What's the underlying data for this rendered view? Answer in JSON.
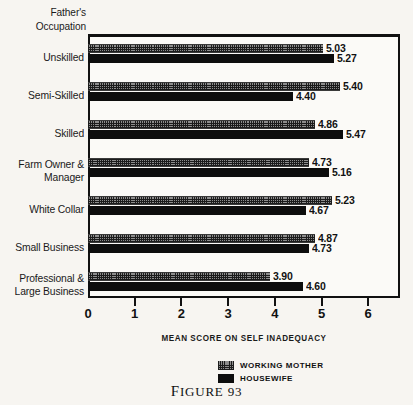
{
  "axis_title": "Father's\nOccupation",
  "caption": "FIGURE 93",
  "legend": {
    "items": [
      {
        "label": "WORKING MOTHER",
        "key": "working_mother",
        "pattern": "cross-hatch",
        "color": "#8d8d8d"
      },
      {
        "label": "HOUSEWIFE",
        "key": "housewife",
        "pattern": "solid",
        "color": "#0d0d0d"
      }
    ]
  },
  "chart_data": {
    "type": "bar",
    "orientation": "horizontal",
    "title": "",
    "subtitle": "",
    "xlabel": "MEAN SCORE ON SELF INADEQUACY",
    "ylabel": "Father's Occupation",
    "xlim": [
      0,
      6.7
    ],
    "xticks": [
      0,
      1,
      2,
      3,
      4,
      5,
      6
    ],
    "xtick_labels": [
      "0",
      "1",
      "2",
      "3",
      "4",
      "5",
      "6"
    ],
    "grid": false,
    "legend_position": "bottom-center",
    "categories": [
      "Unskilled",
      "Semi-Skilled",
      "Skilled",
      "Farm Owner &\nManager",
      "White Collar",
      "Small Business",
      "Professional &\nLarge Business"
    ],
    "series": [
      {
        "name": "WORKING MOTHER",
        "values": [
          5.03,
          5.4,
          4.86,
          4.73,
          5.23,
          4.87,
          3.9
        ],
        "value_labels": [
          "5.03",
          "5.40",
          "4.86",
          "4.73",
          "5.23",
          "4.87",
          "3.90"
        ]
      },
      {
        "name": "HOUSEWIFE",
        "values": [
          5.27,
          4.4,
          5.47,
          5.16,
          4.67,
          4.73,
          4.6
        ],
        "value_labels": [
          "5.27",
          "4.40",
          "5.47",
          "5.16",
          "4.67",
          "4.73",
          "4.60"
        ]
      }
    ]
  }
}
